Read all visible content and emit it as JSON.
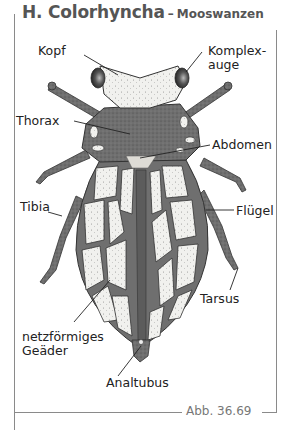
{
  "header": {
    "title": "H. Colorhyncha",
    "separator": "–",
    "subtitle": "Mooswanzen"
  },
  "figure": {
    "colors": {
      "body_dark": "#6f6f6f",
      "wing_cell": "#f1f1ee",
      "outline": "#333333",
      "eye": "#3a3a3a",
      "frame": "#8a8a8a"
    },
    "labels": {
      "kopf": "Kopf",
      "komplexauge_line1": "Komplex-",
      "komplexauge_line2": "auge",
      "thorax": "Thorax",
      "abdomen": "Abdomen",
      "tibia": "Tibia",
      "fluegel": "Flügel",
      "tarsus": "Tarsus",
      "geaeder_line1": "netzförmiges",
      "geaeder_line2": "Geäder",
      "analtubus": "Analtubus"
    }
  },
  "caption": "Abb. 36.69"
}
